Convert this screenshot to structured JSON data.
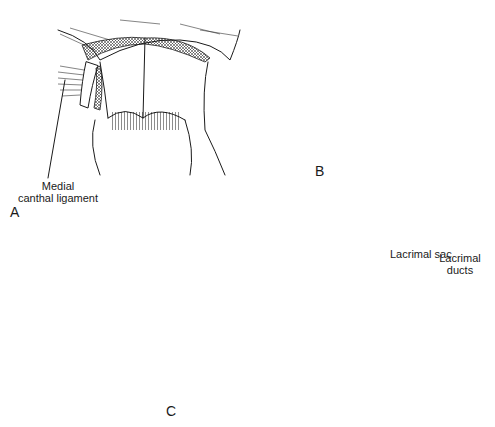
{
  "figure": {
    "panels": [
      {
        "id": "A",
        "letter": "A",
        "labels": [
          {
            "text_line1": "Medial",
            "text_line2": "canthal ligament"
          }
        ]
      },
      {
        "id": "B",
        "letter": "B",
        "labels": []
      },
      {
        "id": "C",
        "letter": "C",
        "labels": [
          {
            "text": "Lacrimal sac"
          },
          {
            "text_line1": "Lacrimal",
            "text_line2": "ducts"
          }
        ]
      }
    ],
    "colors": {
      "ink": "#1a1a1a",
      "background": "#ffffff"
    }
  }
}
